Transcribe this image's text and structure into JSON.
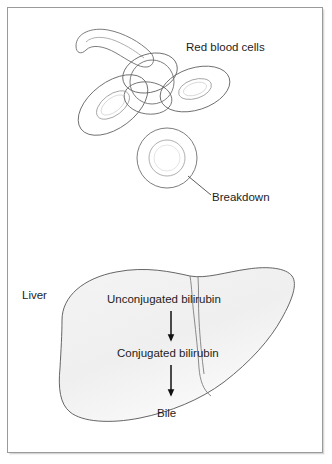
{
  "figure": {
    "background_color": "#ffffff",
    "frame_color": "#9a9a9a"
  },
  "labels": {
    "red_blood_cells": "Red blood cells",
    "breakdown": "Breakdown",
    "liver": "Liver",
    "unconjugated_bilirubin": "Unconjugated bilirubin",
    "conjugated_bilirubin": "Conjugated bilirubin",
    "bile": "Bile"
  },
  "diagram": {
    "type": "flow",
    "upper_section": {
      "name": "red-blood-cell-cluster",
      "cell_count": 5,
      "cells": [
        {
          "name": "rbc-edge-on-curved",
          "orientation": "edge-on"
        },
        {
          "name": "rbc-sphere-center",
          "orientation": "face-on"
        },
        {
          "name": "rbc-tilted-left",
          "orientation": "tilted"
        },
        {
          "name": "rbc-tilted-right",
          "orientation": "tilted"
        },
        {
          "name": "rbc-isolated-breakdown",
          "orientation": "face-on"
        }
      ]
    },
    "lower_section": {
      "name": "liver",
      "fill_color": "#f2f2f2",
      "outline_color": "#555555",
      "flow_steps": [
        "Unconjugated bilirubin",
        "Conjugated bilirubin",
        "Bile"
      ]
    }
  }
}
